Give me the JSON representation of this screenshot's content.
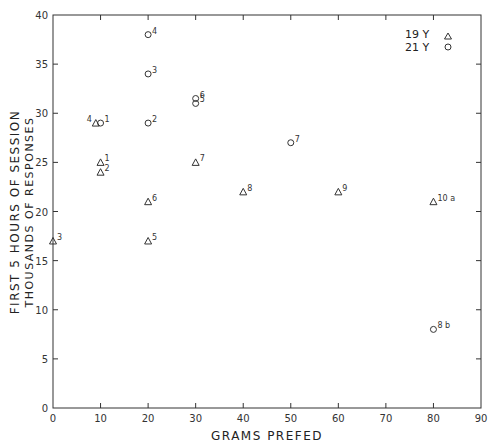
{
  "chart_data": {
    "type": "scatter",
    "title": "",
    "xlabel": "GRAMS PREFED",
    "ylabel_line1": "FIRST 5 HOURS OF SESSION",
    "ylabel_line2": "THOUSANDS OF RESPONSES",
    "xlim": [
      0,
      90
    ],
    "ylim": [
      0,
      40
    ],
    "xticks": [
      0,
      10,
      20,
      30,
      40,
      50,
      60,
      70,
      80,
      90
    ],
    "yticks": [
      0,
      5,
      10,
      15,
      20,
      25,
      30,
      35,
      40
    ],
    "grid": false,
    "legend_position": "top-right",
    "series": [
      {
        "name": "19 Y",
        "marker": "triangle",
        "points": [
          {
            "x": 0,
            "y": 17,
            "label": "3"
          },
          {
            "x": 9,
            "y": 29,
            "label": "4"
          },
          {
            "x": 10,
            "y": 25,
            "label": "1"
          },
          {
            "x": 10,
            "y": 24,
            "label": "2"
          },
          {
            "x": 20,
            "y": 21,
            "label": "6"
          },
          {
            "x": 20,
            "y": 17,
            "label": "5"
          },
          {
            "x": 30,
            "y": 25,
            "label": "7"
          },
          {
            "x": 40,
            "y": 22,
            "label": "8"
          },
          {
            "x": 60,
            "y": 22,
            "label": "9"
          },
          {
            "x": 80,
            "y": 21,
            "label": "10 a"
          }
        ]
      },
      {
        "name": "21 Y",
        "marker": "circle",
        "points": [
          {
            "x": 10,
            "y": 29,
            "label": "1"
          },
          {
            "x": 20,
            "y": 38,
            "label": "4"
          },
          {
            "x": 20,
            "y": 34,
            "label": "3"
          },
          {
            "x": 20,
            "y": 29,
            "label": "2"
          },
          {
            "x": 30,
            "y": 31.5,
            "label": "6"
          },
          {
            "x": 30,
            "y": 31,
            "label": "5"
          },
          {
            "x": 50,
            "y": 27,
            "label": "7"
          },
          {
            "x": 80,
            "y": 8,
            "label": "8 b"
          }
        ]
      }
    ]
  },
  "legend": {
    "items": [
      {
        "label": "19 Y",
        "marker": "triangle"
      },
      {
        "label": "21 Y",
        "marker": "circle"
      }
    ]
  },
  "colors": {
    "ink": "#222222",
    "background": "#ffffff"
  }
}
